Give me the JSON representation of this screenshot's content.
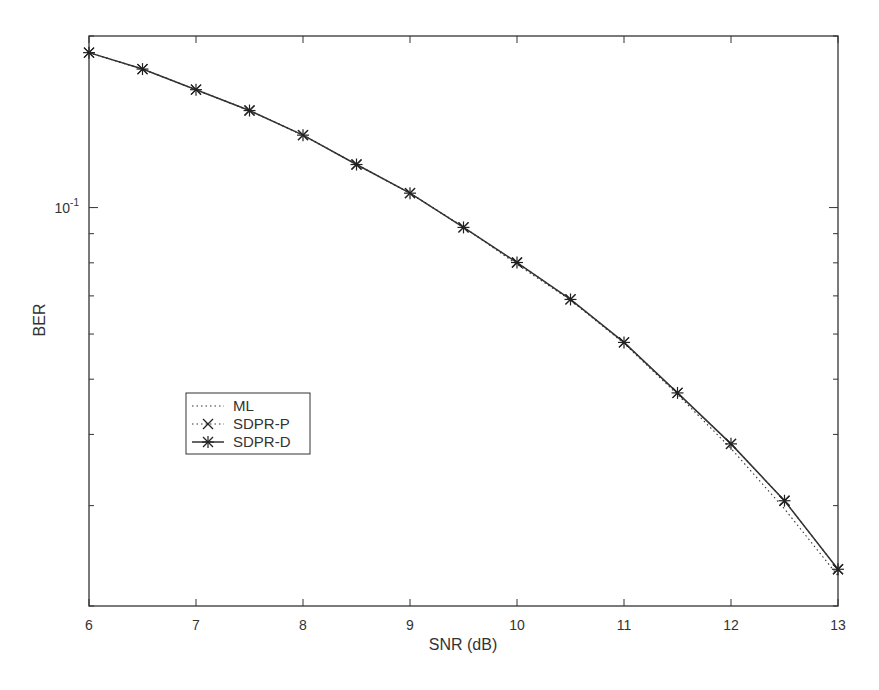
{
  "chart_data": {
    "type": "line",
    "title": "",
    "xlabel": "SNR (dB)",
    "ylabel": "BER",
    "xlim": [
      6,
      13
    ],
    "ylim": [
      0.02,
      0.2
    ],
    "yscale": "log",
    "grid": false,
    "legend_position": "center-left",
    "x_ticks": [
      6,
      7,
      8,
      9,
      10,
      11,
      12,
      13
    ],
    "x_tick_labels": [
      "6",
      "7",
      "8",
      "9",
      "10",
      "11",
      "12",
      "13"
    ],
    "y_tick_labels": [
      {
        "value": 0.1,
        "label": "10",
        "exponent": "-1"
      }
    ],
    "x": [
      6,
      6.5,
      7,
      7.5,
      8,
      8.5,
      9,
      9.5,
      10,
      10.5,
      11,
      11.5,
      12,
      12.5,
      13
    ],
    "series": [
      {
        "name": "ML",
        "style": "dotted",
        "marker": "none",
        "values": [
          0.187,
          0.175,
          0.161,
          0.148,
          0.134,
          0.119,
          0.106,
          0.0925,
          0.0795,
          0.0688,
          0.0578,
          0.047,
          0.0378,
          0.0296,
          0.0226
        ]
      },
      {
        "name": "SDPR-P",
        "style": "dotted",
        "marker": "x",
        "values": [
          0.187,
          0.175,
          0.161,
          0.148,
          0.134,
          0.119,
          0.106,
          0.0923,
          0.0801,
          0.069,
          0.058,
          0.0473,
          0.0385,
          0.0306,
          0.0232
        ]
      },
      {
        "name": "SDPR-D",
        "style": "solid",
        "marker": "asterisk",
        "values": [
          0.187,
          0.175,
          0.161,
          0.148,
          0.134,
          0.119,
          0.106,
          0.0923,
          0.0801,
          0.069,
          0.058,
          0.0473,
          0.0385,
          0.0306,
          0.0232
        ]
      }
    ]
  },
  "legend": {
    "items": [
      "ML",
      "SDPR-P",
      "SDPR-D"
    ]
  }
}
